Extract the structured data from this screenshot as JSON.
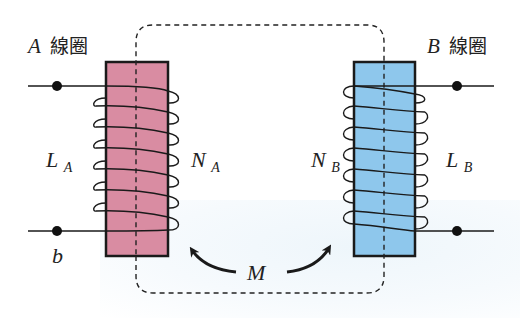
{
  "diagram": {
    "type": "mutual-inductance-transformer",
    "colors": {
      "coil_a_core": "#d98ca2",
      "coil_b_core": "#8ec7ec",
      "line": "#1a1a1a",
      "dashed_flux": "#222222",
      "background": "#ffffff"
    },
    "coil_a": {
      "title_letter": "A",
      "title_kanji": "線圈",
      "inductance_main": "L",
      "inductance_sub": "A",
      "turns_main": "N",
      "turns_sub": "A",
      "terminal_bottom_label": "b",
      "turns_drawn": 7
    },
    "coil_b": {
      "title_letter": "B",
      "title_kanji": "線圈",
      "inductance_main": "L",
      "inductance_sub": "B",
      "turns_main": "N",
      "turns_sub": "B",
      "turns_drawn": 7
    },
    "mutual": {
      "label": "M"
    }
  }
}
